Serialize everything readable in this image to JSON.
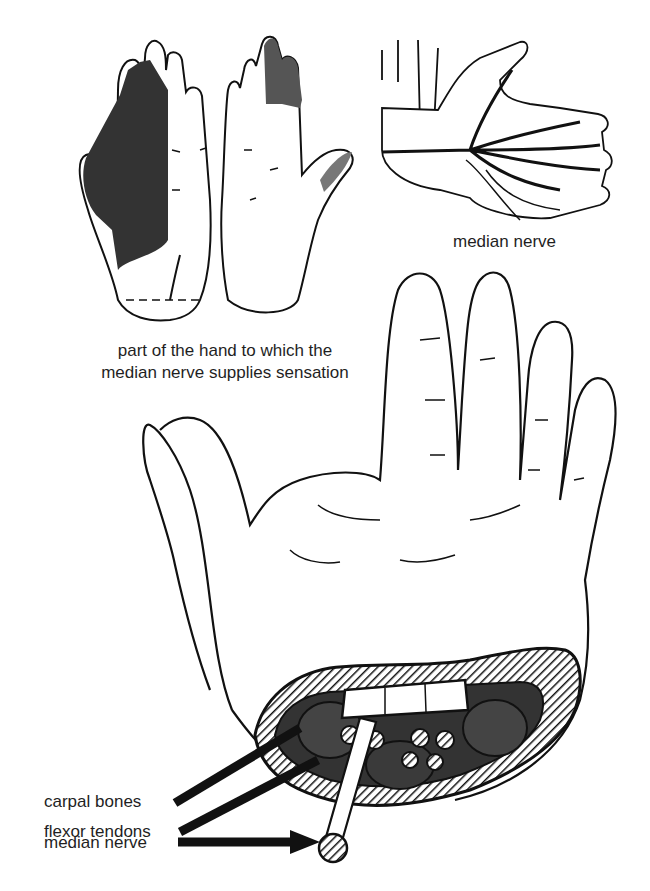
{
  "diagram": {
    "panels": {
      "sensation_map": {
        "caption_line1": "part of the hand to which the",
        "caption_line2": "median nerve supplies sensation"
      },
      "nerve_path": {
        "label": "median nerve"
      },
      "carpal_tunnel": {
        "labels": [
          {
            "text": "carpal bones"
          },
          {
            "text": "flexor tendons"
          },
          {
            "text": "median nerve"
          }
        ]
      }
    },
    "colors": {
      "ink": "#111111",
      "shading": "#3a3a3a",
      "light_shading": "#8a8a8a",
      "background": "#ffffff"
    }
  }
}
